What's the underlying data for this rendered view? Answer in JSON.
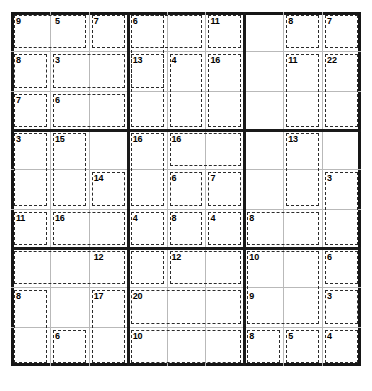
{
  "puzzle": {
    "type": "killer-sudoku",
    "title": "Killer Sudoku",
    "grid_size": 9,
    "block_size": 3,
    "given_values": [],
    "colors": {
      "background": "#ffffff",
      "outer_border": "#161616",
      "block_line": "#1a1a1a",
      "cell_line": "#b9b9b9",
      "cage_line": "#2b2b2b",
      "sum_text": "#000000"
    },
    "cages": [
      {
        "id": "c01",
        "sum": "9",
        "r": 0,
        "c": 0,
        "w": 2,
        "h": 1,
        "sum_row": 0,
        "sum_col": 0
      },
      {
        "id": "c02",
        "sum": "5",
        "r": 0,
        "c": 2,
        "w": 2,
        "h": 1,
        "sum_row": 0,
        "sum_col": 2
      },
      {
        "id": "c03",
        "sum": "7",
        "r": 0,
        "c": 4,
        "w": 1,
        "h": 1,
        "sum_row": 0,
        "sum_col": 4
      },
      {
        "id": "c04",
        "sum": "8",
        "r": 1,
        "c": 0,
        "w": 2,
        "h": 1,
        "sum_row": 1,
        "sum_col": 0
      },
      {
        "id": "c05",
        "sum": "3",
        "r": 1,
        "c": 2,
        "w": 2,
        "h": 1,
        "sum_row": 1,
        "sum_col": 2
      },
      {
        "id": "c06",
        "sum": "7",
        "r": 2,
        "c": 0,
        "w": 2,
        "h": 1,
        "sum_row": 2,
        "sum_col": 0
      },
      {
        "id": "c07",
        "sum": "6",
        "r": 2,
        "c": 2,
        "w": 3,
        "h": 1,
        "sum_row": 2,
        "sum_col": 2
      },
      {
        "id": "c08",
        "sum": "6",
        "r": 0,
        "c": 6,
        "w": 4,
        "h": 1,
        "sum_row": 0,
        "sum_col": 6
      },
      {
        "id": "c09",
        "sum": "11",
        "r": 0,
        "c": 10,
        "w": 2,
        "h": 1,
        "sum_row": 0,
        "sum_col": 10
      },
      {
        "id": "c10",
        "sum": "13",
        "r": 1,
        "c": 6,
        "w": 2,
        "h": 2,
        "sum_row": 1,
        "sum_col": 6
      },
      {
        "id": "c11",
        "sum": "4",
        "r": 1,
        "c": 8,
        "w": 2,
        "h": 2,
        "sum_row": 1,
        "sum_col": 8
      },
      {
        "id": "c12",
        "sum": "16",
        "r": 1,
        "c": 10,
        "w": 2,
        "h": 2,
        "sum_row": 1,
        "sum_col": 10
      },
      {
        "id": "c13",
        "sum": "8",
        "r": 0,
        "c": 14,
        "w": 2,
        "h": 1,
        "sum_row": 0,
        "sum_col": 14
      },
      {
        "id": "c14",
        "sum": "7",
        "r": 0,
        "c": 16,
        "w": 2,
        "h": 1,
        "sum_row": 0,
        "sum_col": 16
      },
      {
        "id": "c15",
        "sum": "11",
        "r": 1,
        "c": 14,
        "w": 2,
        "h": 2,
        "sum_row": 1,
        "sum_col": 14
      },
      {
        "id": "c16",
        "sum": "22",
        "r": 1,
        "c": 16,
        "w": 2,
        "h": 2,
        "sum_row": 1,
        "sum_col": 16
      },
      {
        "id": "c17",
        "sum": "3",
        "r": 3,
        "c": 0,
        "w": 1,
        "h": 2,
        "sum_row": 3,
        "sum_col": 0
      },
      {
        "id": "c18",
        "sum": "15",
        "r": 3,
        "c": 2,
        "w": 2,
        "h": 2,
        "sum_row": 3,
        "sum_col": 2
      },
      {
        "id": "c19",
        "sum": "14",
        "r": 4,
        "c": 4,
        "w": 2,
        "h": 2,
        "sum_row": 4,
        "sum_col": 4
      },
      {
        "id": "c20",
        "sum": "11",
        "r": 5,
        "c": 0,
        "w": 1,
        "h": 2,
        "sum_row": 5,
        "sum_col": 0
      },
      {
        "id": "c21",
        "sum": "16",
        "r": 5,
        "c": 2,
        "w": 2,
        "h": 2,
        "sum_row": 5,
        "sum_col": 2
      },
      {
        "id": "c22",
        "sum": "16",
        "r": 3,
        "c": 6,
        "w": 1,
        "h": 2,
        "sum_row": 3,
        "sum_col": 6
      },
      {
        "id": "c23",
        "sum": "16",
        "r": 3,
        "c": 8,
        "w": 3,
        "h": 1,
        "sum_row": 3,
        "sum_col": 8
      },
      {
        "id": "c24",
        "sum": "6",
        "r": 4,
        "c": 8,
        "w": 1,
        "h": 2,
        "sum_row": 4,
        "sum_col": 8
      },
      {
        "id": "c25",
        "sum": "7",
        "r": 4,
        "c": 10,
        "w": 2,
        "h": 1,
        "sum_row": 4,
        "sum_col": 10
      },
      {
        "id": "c26",
        "sum": "4",
        "r": 5,
        "c": 6,
        "w": 1,
        "h": 1,
        "sum_row": 5,
        "sum_col": 6
      },
      {
        "id": "c27",
        "sum": "8",
        "r": 5,
        "c": 8,
        "w": 1,
        "h": 1,
        "sum_row": 5,
        "sum_col": 8
      },
      {
        "id": "c28",
        "sum": "4",
        "r": 5,
        "c": 10,
        "w": 1,
        "h": 1,
        "sum_row": 5,
        "sum_col": 10
      },
      {
        "id": "c29",
        "sum": "13",
        "r": 3,
        "c": 14,
        "w": 1,
        "h": 2,
        "sum_row": 3,
        "sum_col": 14
      },
      {
        "id": "c30",
        "sum": "3",
        "r": 4,
        "c": 16,
        "w": 1,
        "h": 2,
        "sum_row": 4,
        "sum_col": 16
      },
      {
        "id": "c31",
        "sum": "8",
        "r": 5,
        "c": 12,
        "w": 2,
        "h": 1,
        "sum_row": 5,
        "sum_col": 12
      },
      {
        "id": "c32",
        "sum": "12",
        "r": 6,
        "c": 8,
        "w": 2,
        "h": 1,
        "sum_row": 6,
        "sum_col": 8
      },
      {
        "id": "c33",
        "sum": "10",
        "r": 6,
        "c": 12,
        "w": 2,
        "h": 2,
        "sum_row": 6,
        "sum_col": 12
      },
      {
        "id": "c34",
        "sum": "6",
        "r": 6,
        "c": 16,
        "w": 1,
        "h": 1,
        "sum_row": 6,
        "sum_col": 16
      },
      {
        "id": "c35",
        "sum": "12",
        "r": 6,
        "c": 4,
        "w": 1,
        "h": 1,
        "sum_row": 6,
        "sum_col": 4
      },
      {
        "id": "c36",
        "sum": "8",
        "r": 7,
        "c": 0,
        "w": 2,
        "h": 2,
        "sum_row": 7,
        "sum_col": 0
      },
      {
        "id": "c37",
        "sum": "17",
        "r": 7,
        "c": 4,
        "w": 1,
        "h": 2,
        "sum_row": 7,
        "sum_col": 4
      },
      {
        "id": "c38",
        "sum": "6",
        "r": 8,
        "c": 2,
        "w": 1,
        "h": 1,
        "sum_row": 8,
        "sum_col": 2
      },
      {
        "id": "c39",
        "sum": "20",
        "r": 7,
        "c": 6,
        "w": 2,
        "h": 1,
        "sum_row": 7,
        "sum_col": 6
      },
      {
        "id": "c40",
        "sum": "10",
        "r": 8,
        "c": 6,
        "w": 2,
        "h": 1,
        "sum_row": 8,
        "sum_col": 6
      },
      {
        "id": "c41",
        "sum": "9",
        "r": 7,
        "c": 12,
        "w": 2,
        "h": 1,
        "sum_row": 7,
        "sum_col": 12
      },
      {
        "id": "c42",
        "sum": "3",
        "r": 7,
        "c": 16,
        "w": 1,
        "h": 1,
        "sum_row": 7,
        "sum_col": 16
      },
      {
        "id": "c43",
        "sum": "8",
        "r": 8,
        "c": 12,
        "w": 1,
        "h": 1,
        "sum_row": 8,
        "sum_col": 12
      },
      {
        "id": "c44",
        "sum": "5",
        "r": 8,
        "c": 14,
        "w": 1,
        "h": 1,
        "sum_row": 8,
        "sum_col": 14
      },
      {
        "id": "c45",
        "sum": "4",
        "r": 8,
        "c": 16,
        "w": 1,
        "h": 1,
        "sum_row": 8,
        "sum_col": 16
      }
    ],
    "cage_rects": [
      {
        "id": "r01",
        "r0": 0,
        "c0": 0,
        "r1": 0,
        "c1": 1
      },
      {
        "id": "r02",
        "r0": 0,
        "c0": 2,
        "r1": 0,
        "c1": 2
      },
      {
        "id": "r03",
        "r0": 0,
        "c0": 3,
        "r1": 1,
        "c1": 3
      },
      {
        "id": "r04",
        "r0": 1,
        "c0": 0,
        "r1": 1,
        "c1": 0
      },
      {
        "id": "r05",
        "r0": 1,
        "c0": 1,
        "r1": 1,
        "c1": 2
      },
      {
        "id": "r06",
        "r0": 2,
        "c0": 0,
        "r1": 2,
        "c1": 0
      },
      {
        "id": "r07",
        "r0": 2,
        "c0": 1,
        "r1": 2,
        "c1": 2
      },
      {
        "id": "r08",
        "r0": 0,
        "c0": 3,
        "r1": 0,
        "c1": 4
      },
      {
        "id": "r09",
        "r0": 0,
        "c0": 5,
        "r1": 0,
        "c1": 5
      },
      {
        "id": "r10",
        "r0": 1,
        "c0": 3,
        "r1": 2,
        "c1": 3
      },
      {
        "id": "r11",
        "r0": 1,
        "c0": 4,
        "r1": 2,
        "c1": 4
      },
      {
        "id": "r12",
        "r0": 1,
        "c0": 5,
        "r1": 2,
        "c1": 5
      },
      {
        "id": "r13",
        "r0": 0,
        "c0": 7,
        "r1": 0,
        "c1": 7
      },
      {
        "id": "r14",
        "r0": 0,
        "c0": 8,
        "r1": 0,
        "c1": 8
      },
      {
        "id": "r15",
        "r0": 1,
        "c0": 7,
        "r1": 2,
        "c1": 7
      },
      {
        "id": "r16",
        "r0": 1,
        "c0": 8,
        "r1": 2,
        "c1": 8
      },
      {
        "id": "r17",
        "r0": 3,
        "c0": 0,
        "r1": 4,
        "c1": 0
      },
      {
        "id": "r18",
        "r0": 3,
        "c0": 1,
        "r1": 4,
        "c1": 1
      },
      {
        "id": "r19",
        "r0": 4,
        "c0": 2,
        "r1": 4,
        "c1": 2
      },
      {
        "id": "r20",
        "r0": 5,
        "c0": 0,
        "r1": 5,
        "c1": 0
      },
      {
        "id": "r21",
        "r0": 5,
        "c0": 1,
        "r1": 5,
        "c1": 2
      },
      {
        "id": "r22",
        "r0": 3,
        "c0": 3,
        "r1": 4,
        "c1": 3
      },
      {
        "id": "r23",
        "r0": 3,
        "c0": 4,
        "r1": 3,
        "c1": 5
      },
      {
        "id": "r24",
        "r0": 4,
        "c0": 4,
        "r1": 4,
        "c1": 4
      },
      {
        "id": "r25",
        "r0": 4,
        "c0": 5,
        "r1": 4,
        "c1": 5
      },
      {
        "id": "r26",
        "r0": 5,
        "c0": 3,
        "r1": 5,
        "c1": 3
      },
      {
        "id": "r27",
        "r0": 5,
        "c0": 4,
        "r1": 5,
        "c1": 4
      },
      {
        "id": "r28",
        "r0": 5,
        "c0": 5,
        "r1": 5,
        "c1": 5
      },
      {
        "id": "r29",
        "r0": 3,
        "c0": 7,
        "r1": 4,
        "c1": 7
      },
      {
        "id": "r30",
        "r0": 4,
        "c0": 8,
        "r1": 5,
        "c1": 8
      },
      {
        "id": "r31",
        "r0": 5,
        "c0": 6,
        "r1": 5,
        "c1": 7
      },
      {
        "id": "r32",
        "r0": 6,
        "c0": 4,
        "r1": 6,
        "c1": 5
      },
      {
        "id": "r33",
        "r0": 6,
        "c0": 6,
        "r1": 7,
        "c1": 7
      },
      {
        "id": "r34",
        "r0": 6,
        "c0": 8,
        "r1": 6,
        "c1": 8
      },
      {
        "id": "r35",
        "r0": 7,
        "c0": 0,
        "r1": 8,
        "c1": 0
      },
      {
        "id": "r36",
        "r0": 7,
        "c0": 2,
        "r1": 8,
        "c1": 2
      },
      {
        "id": "r37",
        "r0": 8,
        "c0": 1,
        "r1": 8,
        "c1": 1
      },
      {
        "id": "r38",
        "r0": 7,
        "c0": 3,
        "r1": 7,
        "c1": 5
      },
      {
        "id": "r39",
        "r0": 8,
        "c0": 3,
        "r1": 8,
        "c1": 5
      },
      {
        "id": "r40",
        "r0": 8,
        "c0": 6,
        "r1": 8,
        "c1": 6
      },
      {
        "id": "r41",
        "r0": 8,
        "c0": 7,
        "r1": 8,
        "c1": 7
      },
      {
        "id": "r42",
        "r0": 7,
        "c0": 8,
        "r1": 7,
        "c1": 8
      },
      {
        "id": "r43",
        "r0": 8,
        "c0": 8,
        "r1": 8,
        "c1": 8
      },
      {
        "id": "r44",
        "r0": 6,
        "c0": 0,
        "r1": 6,
        "c1": 2
      },
      {
        "id": "r45",
        "r0": 6,
        "c0": 3,
        "r1": 6,
        "c1": 3
      }
    ]
  }
}
